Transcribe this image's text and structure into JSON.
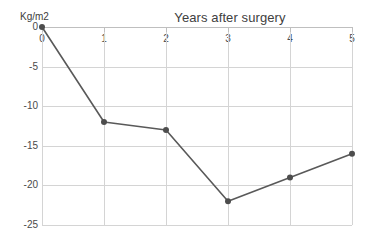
{
  "chart_data": {
    "type": "line",
    "title": "Years after surgery",
    "xlabel": "Years after surgery",
    "ylabel": "Kg/m2",
    "x": [
      0,
      1,
      2,
      3,
      4,
      5
    ],
    "categories": [
      "0",
      "1",
      "2",
      "3",
      "4",
      "5"
    ],
    "values": [
      0,
      -12,
      -13,
      -22,
      -19,
      -16
    ],
    "series": [
      {
        "name": "BMI change",
        "values": [
          0,
          -12,
          -13,
          -22,
          -19,
          -16
        ]
      }
    ],
    "xlim": [
      0,
      5
    ],
    "ylim": [
      -25,
      0
    ],
    "x_ticks": [
      "0",
      "1",
      "2",
      "3",
      "4",
      "5"
    ],
    "y_ticks": [
      "0",
      "-5",
      "-10",
      "-15",
      "-20",
      "-25"
    ],
    "y_tick_values": [
      0,
      -5,
      -10,
      -15,
      -20,
      -25
    ],
    "grid": true,
    "legend": false,
    "x_axis_position": "top",
    "line_color": "#595959",
    "marker_color": "#4d4d4d",
    "grid_color": "#d4d4d4",
    "axis_color": "#bfbfbf",
    "background_color": "#ffffff"
  },
  "axis": {
    "unit_label": "Kg/m2"
  }
}
